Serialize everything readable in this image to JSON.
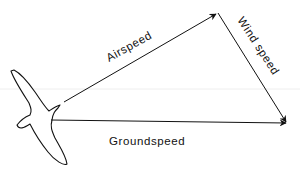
{
  "diagram": {
    "type": "vector-triangle",
    "labels": {
      "airspeed": "Airspeed",
      "wind_speed": "Wind speed",
      "groundspeed": "Groundspeed"
    },
    "colors": {
      "stroke": "#111111",
      "background": "#ffffff"
    }
  }
}
